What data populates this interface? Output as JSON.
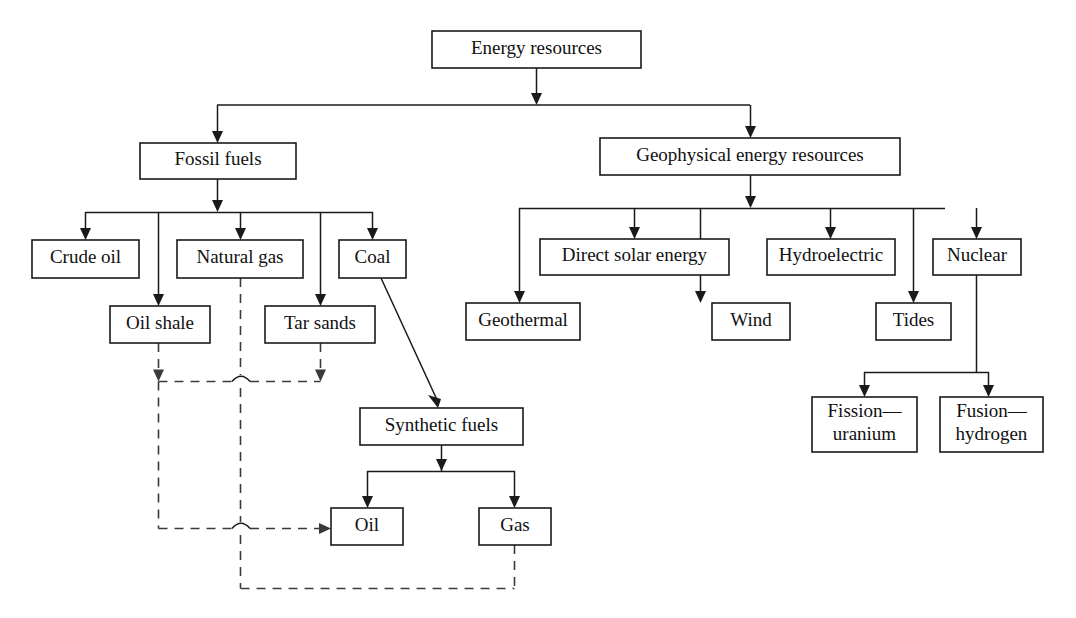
{
  "diagram": {
    "background_color": "#ffffff",
    "line_color": "#1a1a1a",
    "dashed_line_color": "#3a3a3a",
    "box_fill": "#ffffff",
    "nodes": [
      {
        "id": "energy-resources",
        "label": "Energy resources",
        "x": 432,
        "y": 31,
        "w": 209,
        "h": 37
      },
      {
        "id": "fossil-fuels",
        "label": "Fossil fuels",
        "x": 140,
        "y": 143,
        "w": 156,
        "h": 36
      },
      {
        "id": "geophysical",
        "label": "Geophysical energy resources",
        "x": 600,
        "y": 138,
        "w": 300,
        "h": 37
      },
      {
        "id": "crude-oil",
        "label": "Crude oil",
        "x": 32,
        "y": 240,
        "w": 107,
        "h": 38
      },
      {
        "id": "natural-gas",
        "label": "Natural gas",
        "x": 177,
        "y": 240,
        "w": 126,
        "h": 38
      },
      {
        "id": "coal",
        "label": "Coal",
        "x": 339,
        "y": 240,
        "w": 67,
        "h": 38
      },
      {
        "id": "oil-shale",
        "label": "Oil shale",
        "x": 110,
        "y": 306,
        "w": 100,
        "h": 37
      },
      {
        "id": "tar-sands",
        "label": "Tar sands",
        "x": 265,
        "y": 306,
        "w": 110,
        "h": 37
      },
      {
        "id": "direct-solar",
        "label": "Direct solar energy",
        "x": 540,
        "y": 239,
        "w": 189,
        "h": 36
      },
      {
        "id": "hydroelectric",
        "label": "Hydroelectric",
        "x": 767,
        "y": 239,
        "w": 128,
        "h": 36
      },
      {
        "id": "nuclear",
        "label": "Nuclear",
        "x": 933,
        "y": 239,
        "w": 88,
        "h": 36
      },
      {
        "id": "geothermal",
        "label": "Geothermal",
        "x": 466,
        "y": 303,
        "w": 114,
        "h": 37
      },
      {
        "id": "wind",
        "label": "Wind",
        "x": 712,
        "y": 303,
        "w": 78,
        "h": 37
      },
      {
        "id": "tides",
        "label": "Tides",
        "x": 876,
        "y": 303,
        "w": 75,
        "h": 37
      },
      {
        "id": "synthetic-fuels",
        "label": "Synthetic fuels",
        "x": 360,
        "y": 408,
        "w": 163,
        "h": 37
      },
      {
        "id": "oil",
        "label": "Oil",
        "x": 331,
        "y": 508,
        "w": 72,
        "h": 37
      },
      {
        "id": "gas",
        "label": "Gas",
        "x": 479,
        "y": 508,
        "w": 72,
        "h": 37
      },
      {
        "id": "fission-uranium",
        "label": "Fission—\nuranium",
        "x": 812,
        "y": 397,
        "w": 105,
        "h": 55
      },
      {
        "id": "fusion-hydrogen",
        "label": "Fusion—\nhydrogen",
        "x": 940,
        "y": 397,
        "w": 103,
        "h": 55
      }
    ],
    "solid_paths": [
      "M 536.5 68 L 536.5 99",
      "M 217 105 L 750 105",
      "M 217.5 105 L 217.5 137",
      "M 750.5 105 L 750.5 132",
      "M 217.5 179 L 217.5 206",
      "M 750.5 175 L 750.5 202",
      "M 85 212.5 L 373 212.5",
      "M 85.5 212 L 85.5 234",
      "M 158.5 212 L 158.5 300",
      "M 240.5 212 L 240.5 234",
      "M 320.5 212 L 320.5 300",
      "M 372.5 212 L 372.5 234",
      "M 519 208.5 L 945 208.5",
      "M 519.5 208 L 519.5 297",
      "M 634.5 208 L 634.5 233",
      "M 700.5 208 L 700.5 297",
      "M 830.5 208 L 830.5 233",
      "M 913.5 208 L 913.5 297",
      "M 976.5 208 L 976.5 233",
      "M 976.5 275 L 976.5 372",
      "M 864 372.5 L 989 372.5",
      "M 864.5 372 L 864.5 391",
      "M 988.5 372 L 988.5 391",
      "M 381 278 L 438 402",
      "M 441.5 445 L 441.5 471",
      "M 367 471.5 L 515 471.5",
      "M 367.5 471 L 367.5 502",
      "M 514.5 471 L 514.5 502"
    ],
    "dashed_paths": [
      "M 158.5 343 L 158.5 375",
      "M 320.5 343 L 320.5 375",
      "M 158.5 381.5 L 232 381.5",
      "M 250 381.5 L 320.5 381.5",
      "M 240.5 278 L 240.5 375",
      "M 240.5 388 L 240.5 522",
      "M 158.5 381.5 L 158.5 528.5",
      "M 158.5 528.5 L 232 528.5",
      "M 250 528.5 L 325 528.5",
      "M 240.5 535 L 240.5 588.5",
      "M 240.5 588.5 L 514.5 588.5",
      "M 514.5 545 L 514.5 588.5"
    ],
    "hop_arcs": [
      "M 232 381.5 Q 241 371 250 381.5",
      "M 232 528.5 Q 241 518 250 528.5"
    ],
    "arrowheads_solid": [
      {
        "x": 536.5,
        "y": 105,
        "dir": "down"
      },
      {
        "x": 217.5,
        "y": 143,
        "dir": "down"
      },
      {
        "x": 750.5,
        "y": 138,
        "dir": "down"
      },
      {
        "x": 217.5,
        "y": 212,
        "dir": "down"
      },
      {
        "x": 750.5,
        "y": 208,
        "dir": "down"
      },
      {
        "x": 85.5,
        "y": 240,
        "dir": "down"
      },
      {
        "x": 240.5,
        "y": 240,
        "dir": "down"
      },
      {
        "x": 372.5,
        "y": 240,
        "dir": "down"
      },
      {
        "x": 158.5,
        "y": 306,
        "dir": "down"
      },
      {
        "x": 320.5,
        "y": 306,
        "dir": "down"
      },
      {
        "x": 634.5,
        "y": 239,
        "dir": "down"
      },
      {
        "x": 830.5,
        "y": 239,
        "dir": "down"
      },
      {
        "x": 976.5,
        "y": 239,
        "dir": "down"
      },
      {
        "x": 519.5,
        "y": 303,
        "dir": "down"
      },
      {
        "x": 700.5,
        "y": 303,
        "dir": "down"
      },
      {
        "x": 913.5,
        "y": 303,
        "dir": "down"
      },
      {
        "x": 864.5,
        "y": 397,
        "dir": "down"
      },
      {
        "x": 988.5,
        "y": 397,
        "dir": "down"
      },
      {
        "x": 441.5,
        "y": 471,
        "dir": "down"
      },
      {
        "x": 367.5,
        "y": 508,
        "dir": "down"
      },
      {
        "x": 514.5,
        "y": 508,
        "dir": "down"
      },
      {
        "x": 439,
        "y": 408,
        "dir": "diag"
      }
    ],
    "arrowheads_dashed": [
      {
        "x": 158.5,
        "y": 381.5,
        "dir": "down"
      },
      {
        "x": 320.5,
        "y": 381.5,
        "dir": "down"
      },
      {
        "x": 331,
        "y": 528.5,
        "dir": "right"
      }
    ],
    "edges": [
      {
        "from": "energy-resources",
        "to": "fossil-fuels",
        "style": "solid"
      },
      {
        "from": "energy-resources",
        "to": "geophysical",
        "style": "solid"
      },
      {
        "from": "fossil-fuels",
        "to": "crude-oil",
        "style": "solid"
      },
      {
        "from": "fossil-fuels",
        "to": "natural-gas",
        "style": "solid"
      },
      {
        "from": "fossil-fuels",
        "to": "coal",
        "style": "solid"
      },
      {
        "from": "fossil-fuels",
        "to": "oil-shale",
        "style": "solid"
      },
      {
        "from": "fossil-fuels",
        "to": "tar-sands",
        "style": "solid"
      },
      {
        "from": "coal",
        "to": "synthetic-fuels",
        "style": "solid"
      },
      {
        "from": "synthetic-fuels",
        "to": "oil",
        "style": "solid"
      },
      {
        "from": "synthetic-fuels",
        "to": "gas",
        "style": "solid"
      },
      {
        "from": "oil-shale",
        "to": "oil",
        "style": "dashed"
      },
      {
        "from": "tar-sands",
        "to": "oil",
        "style": "dashed"
      },
      {
        "from": "natural-gas",
        "to": "gas",
        "style": "dashed"
      },
      {
        "from": "geophysical",
        "to": "geothermal",
        "style": "solid"
      },
      {
        "from": "geophysical",
        "to": "direct-solar",
        "style": "solid"
      },
      {
        "from": "geophysical",
        "to": "wind",
        "style": "solid"
      },
      {
        "from": "geophysical",
        "to": "hydroelectric",
        "style": "solid"
      },
      {
        "from": "geophysical",
        "to": "tides",
        "style": "solid"
      },
      {
        "from": "geophysical",
        "to": "nuclear",
        "style": "solid"
      },
      {
        "from": "nuclear",
        "to": "fission-uranium",
        "style": "solid"
      },
      {
        "from": "nuclear",
        "to": "fusion-hydrogen",
        "style": "solid"
      }
    ]
  }
}
